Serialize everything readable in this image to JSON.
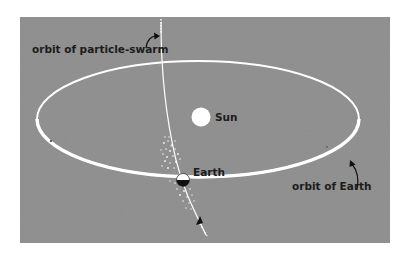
{
  "figure": {
    "background_color": "#8e8e8e",
    "line_color": "#ffffff",
    "text_color": "#1c1c1c",
    "labels": {
      "particle_orbit": "orbit of particle-swarm",
      "sun": "Sun",
      "earth": "Earth",
      "earth_orbit": "orbit of Earth"
    }
  }
}
